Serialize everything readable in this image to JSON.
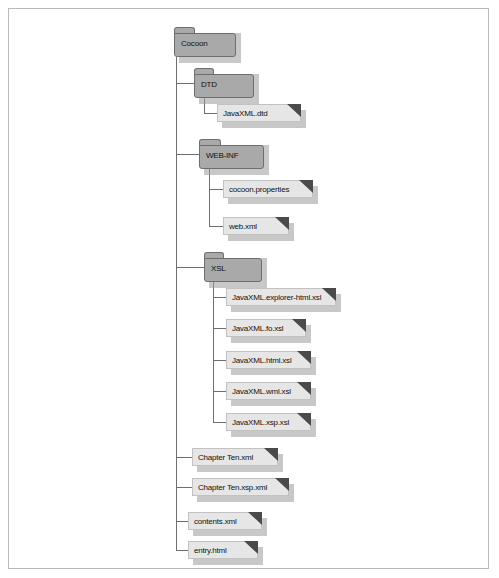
{
  "figure": {
    "root": {
      "name": "Cocoon",
      "type": "folder"
    },
    "nodes": [
      {
        "label": "Cocoon",
        "type": "folder",
        "depth": 0,
        "icon": "folder-icon"
      },
      {
        "label": "DTD",
        "type": "folder",
        "depth": 1,
        "icon": "folder-icon"
      },
      {
        "label": "JavaXML.dtd",
        "type": "file",
        "depth": 2,
        "icon": "file-icon"
      },
      {
        "label": "WEB-INF",
        "type": "folder",
        "depth": 1,
        "icon": "folder-icon"
      },
      {
        "label": "cocoon.properties",
        "type": "file",
        "depth": 2,
        "icon": "file-icon"
      },
      {
        "label": "web.xml",
        "type": "file",
        "depth": 2,
        "icon": "file-icon"
      },
      {
        "label": "XSL",
        "type": "folder",
        "depth": 1,
        "icon": "folder-icon"
      },
      {
        "label": "JavaXML.explorer-html.xsl",
        "type": "file",
        "depth": 2,
        "icon": "file-icon"
      },
      {
        "label": "JavaXML.fo.xsl",
        "type": "file",
        "depth": 2,
        "icon": "file-icon"
      },
      {
        "label": "JavaXML.html.xsl",
        "type": "file",
        "depth": 2,
        "icon": "file-icon"
      },
      {
        "label": "JavaXML.wml.xsl",
        "type": "file",
        "depth": 2,
        "icon": "file-icon"
      },
      {
        "label": "JavaXML.xsp.xsl",
        "type": "file",
        "depth": 2,
        "icon": "file-icon"
      },
      {
        "label": "Chapter Ten.xml",
        "type": "file",
        "depth": 1,
        "icon": "file-icon"
      },
      {
        "label": "Chapter Ten.xsp.xml",
        "type": "file",
        "depth": 1,
        "icon": "file-icon"
      },
      {
        "label": "contents.xml",
        "type": "file",
        "depth": 1,
        "icon": "file-icon"
      },
      {
        "label": "entry.html",
        "type": "file",
        "depth": 1,
        "icon": "file-icon"
      }
    ],
    "colors": {
      "folder_fill": "#a9a9a9",
      "folder_stroke": "#6e6e6e",
      "file_fill": "#e6e6e6",
      "file_stroke": "#c2c2c2",
      "file_corner": "#4a4a4a",
      "shadow": "#9a9a9a",
      "connector": "#6f6f6f",
      "frame_border": "#b9b9b9",
      "text": "#111111",
      "background": "#ffffff"
    }
  }
}
